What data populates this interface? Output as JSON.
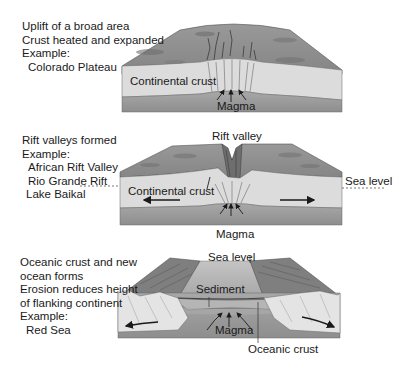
{
  "panels": [
    {
      "stage": "uplift",
      "description": [
        "Uplift of a broad area",
        "Crust heated and expanded",
        "Example:"
      ],
      "examples": [
        "Colorado Plateau"
      ],
      "labels": {
        "crust": "Continental crust",
        "magma": "Magma"
      }
    },
    {
      "stage": "rift-valley",
      "description": [
        "Rift valleys formed",
        "Example:"
      ],
      "examples": [
        "African Rift Valley",
        "Rio Grande Rift"
      ],
      "extra_example": "Lake Baikal",
      "labels": {
        "rift": "Rift valley",
        "crust": "Continental crust",
        "sea_level": "Sea level",
        "magma": "Magma"
      }
    },
    {
      "stage": "ocean-basin",
      "description": [
        "Oceanic crust and new",
        "ocean forms",
        "Erosion reduces height",
        "of flanking continent",
        "Example:"
      ],
      "examples": [
        "Red Sea"
      ],
      "labels": {
        "sea_level": "Sea level",
        "sediment": "Sediment",
        "magma": "Magma",
        "oceanic_crust": "Oceanic crust"
      }
    }
  ],
  "colors": {
    "surface": "#8f8f8f",
    "surface_dark": "#6e6e6e",
    "crust": "#dcdcdc",
    "mantle": "#9c9c9c",
    "water": "#b8b8b8",
    "text": "#1a1a1a"
  }
}
